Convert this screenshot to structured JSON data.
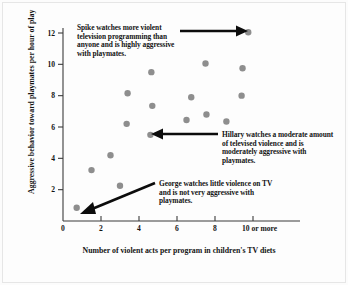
{
  "chart_data": {
    "type": "scatter",
    "title": "",
    "xlabel": "Number of violent acts per program in children's TV diets",
    "ylabel": "Aggressive behavior toward playmates per hour of play",
    "xlim": [
      0,
      10.6
    ],
    "ylim": [
      0,
      12.8
    ],
    "grid": false,
    "legend": "none",
    "xticks": [
      0,
      2,
      4,
      6,
      8,
      10
    ],
    "xtick_labels": [
      "0",
      "2",
      "4",
      "6",
      "8",
      "10 or more"
    ],
    "yticks": [
      2,
      4,
      6,
      8,
      10,
      12
    ],
    "ytick_labels": [
      "2",
      "4",
      "6",
      "8",
      "10",
      "12"
    ],
    "marker": {
      "shape": "circle",
      "color": "#8e8e8e",
      "size": 6.4
    },
    "points": [
      {
        "x": 0.72,
        "y": 0.85,
        "label": "George"
      },
      {
        "x": 1.5,
        "y": 3.25
      },
      {
        "x": 2.5,
        "y": 4.2
      },
      {
        "x": 3.0,
        "y": 2.25
      },
      {
        "x": 3.35,
        "y": 6.2
      },
      {
        "x": 3.4,
        "y": 8.15
      },
      {
        "x": 4.6,
        "y": 5.5,
        "label": "Hillary"
      },
      {
        "x": 4.7,
        "y": 7.35
      },
      {
        "x": 4.65,
        "y": 9.5
      },
      {
        "x": 6.5,
        "y": 6.45
      },
      {
        "x": 6.75,
        "y": 7.9
      },
      {
        "x": 7.55,
        "y": 6.8
      },
      {
        "x": 7.5,
        "y": 10.05
      },
      {
        "x": 8.6,
        "y": 6.35
      },
      {
        "x": 9.4,
        "y": 8.0
      },
      {
        "x": 9.45,
        "y": 9.75
      },
      {
        "x": 9.75,
        "y": 12.05,
        "label": "Spike"
      }
    ]
  },
  "annotations": {
    "spike": "Spike watches more violent television programming than anyone and is highly aggressive with playmates.",
    "hillary": "Hillary watches a moderate amount of televised violence and is moderately aggressive with playmates.",
    "george": "George watches little violence on TV and is not very aggressive with playmates."
  },
  "axes": {
    "x_title": "Number of violent acts per program in children's TV diets",
    "y_title": "Aggressive behavior toward playmates per hour of play",
    "x_labels": [
      "0",
      "2",
      "4",
      "6",
      "8",
      "10 or more"
    ],
    "y_labels": [
      "2",
      "4",
      "6",
      "8",
      "10",
      "12"
    ]
  },
  "colors": {
    "marker": "#8e8e8e",
    "axis": "#3b3b3b",
    "text": "#141414",
    "background": "#fdfdfd"
  }
}
